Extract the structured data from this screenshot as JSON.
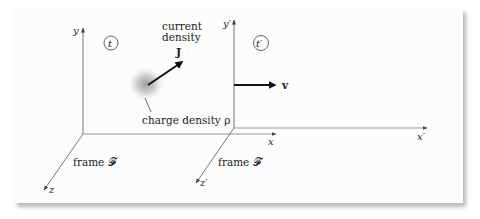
{
  "diagram": {
    "frame_unprimed": {
      "label": "frame 𝓕",
      "axes": {
        "x": "x",
        "y": "y",
        "z": "z"
      },
      "time": "t"
    },
    "frame_primed": {
      "label": "frame 𝓕′",
      "axes": {
        "x": "x′",
        "y": "y′",
        "z": "z′"
      },
      "time": "t′"
    },
    "current_density": {
      "caption_line1": "current",
      "caption_line2": "density",
      "symbol": "J"
    },
    "charge_density": {
      "label": "charge density ρ"
    },
    "velocity": {
      "symbol": "v"
    },
    "colors": {
      "axis": "#777777",
      "arrow": "#111111",
      "text": "#222222",
      "card": "#fcfcfc",
      "cloud": "#9a9a9a"
    }
  }
}
